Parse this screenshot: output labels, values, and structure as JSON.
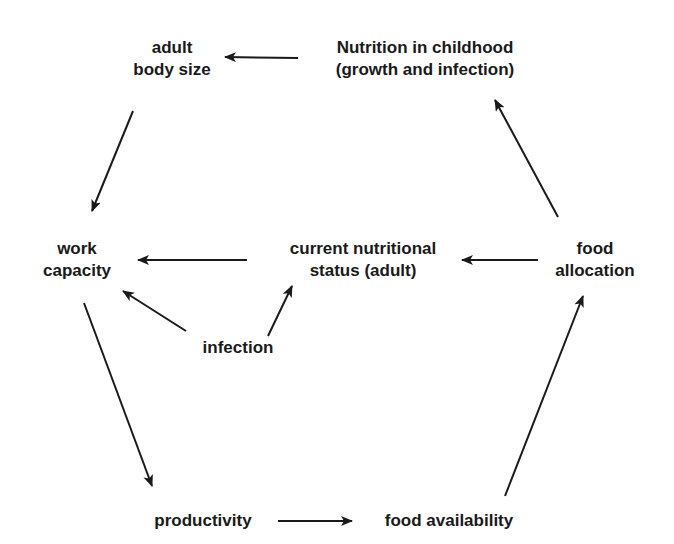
{
  "diagram": {
    "type": "cycle-flow",
    "colors": {
      "text": "#1a1a1a",
      "arrow": "#1a1a1a",
      "background": "#ffffff"
    },
    "nodes": {
      "adult_body_size": {
        "line1": "adult",
        "line2": "body size"
      },
      "nutrition_childhood": {
        "line1": "Nutrition in childhood",
        "line2": "(growth and infection)"
      },
      "work_capacity": {
        "line1": "work",
        "line2": "capacity"
      },
      "current_status": {
        "line1": "current nutritional",
        "line2": "status (adult)"
      },
      "food_allocation": {
        "line1": "food",
        "line2": "allocation"
      },
      "infection": {
        "line1": "infection"
      },
      "productivity": {
        "line1": "productivity"
      },
      "food_availability": {
        "line1": "food availability"
      }
    },
    "edges": [
      {
        "from": "nutrition_childhood",
        "to": "adult_body_size"
      },
      {
        "from": "adult_body_size",
        "to": "work_capacity"
      },
      {
        "from": "current_status",
        "to": "work_capacity"
      },
      {
        "from": "food_allocation",
        "to": "current_status"
      },
      {
        "from": "food_allocation",
        "to": "nutrition_childhood"
      },
      {
        "from": "infection",
        "to": "work_capacity"
      },
      {
        "from": "infection",
        "to": "current_status"
      },
      {
        "from": "work_capacity",
        "to": "productivity"
      },
      {
        "from": "productivity",
        "to": "food_availability"
      },
      {
        "from": "food_availability",
        "to": "food_allocation"
      }
    ]
  }
}
